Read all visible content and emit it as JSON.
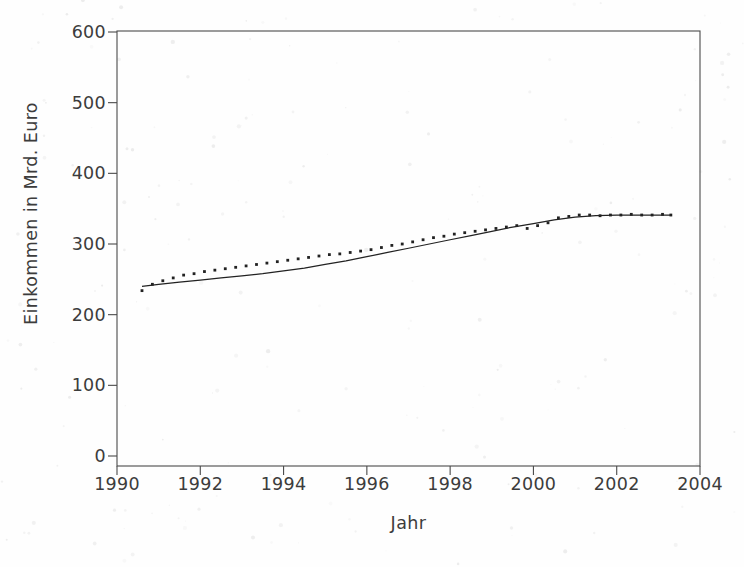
{
  "chart_data": {
    "type": "line",
    "title": "",
    "subtitle": "",
    "xlabel": "Jahr",
    "ylabel": "Einkommen in Mrd. Euro",
    "xlim": [
      1990,
      2004
    ],
    "ylim": [
      0,
      600
    ],
    "xticks": [
      1990,
      1992,
      1994,
      1996,
      1998,
      2000,
      2002,
      2004
    ],
    "xtick_labels": [
      "1990",
      "1992",
      "1994",
      "1996",
      "1998",
      "2000",
      "2002",
      "2004"
    ],
    "yticks": [
      0,
      100,
      200,
      300,
      400,
      500,
      600
    ],
    "ytick_labels": [
      "0",
      "100",
      "200",
      "300",
      "400",
      "500",
      "600"
    ],
    "grid": false,
    "legend": "none",
    "series": [
      {
        "name": "Beobachtete Werte",
        "marker": "dot",
        "linestyle": "none",
        "color": "#222222",
        "x": [
          1990.6,
          1990.85,
          1991.1,
          1991.35,
          1991.6,
          1991.85,
          1992.1,
          1992.35,
          1992.6,
          1992.85,
          1993.1,
          1993.35,
          1993.6,
          1993.85,
          1994.1,
          1994.35,
          1994.6,
          1994.85,
          1995.1,
          1995.35,
          1995.6,
          1995.85,
          1996.1,
          1996.35,
          1996.6,
          1996.85,
          1997.1,
          1997.35,
          1997.6,
          1997.85,
          1998.1,
          1998.35,
          1998.6,
          1998.85,
          1999.1,
          1999.35,
          1999.6,
          1999.85,
          2000.1,
          2000.35,
          2000.6,
          2000.85,
          2001.1,
          2001.35,
          2001.6,
          2001.85,
          2002.1,
          2002.35,
          2002.6,
          2002.85,
          2003.1,
          2003.3
        ],
        "y": [
          234,
          243,
          248,
          252,
          256,
          258,
          261,
          263,
          265,
          267,
          269,
          271,
          273,
          275,
          277,
          279,
          281,
          283,
          285,
          286,
          288,
          290,
          292,
          295,
          298,
          300,
          303,
          306,
          309,
          311,
          314,
          316,
          318,
          320,
          322,
          324,
          326,
          322,
          326,
          330,
          337,
          339,
          341,
          341,
          340,
          341,
          341,
          342,
          341,
          341,
          342,
          341
        ]
      },
      {
        "name": "Geglaettete Trendkurve",
        "marker": "none",
        "linestyle": "solid",
        "color": "#222222",
        "x": [
          1990.6,
          1991.0,
          1991.5,
          1992.0,
          1992.5,
          1993.0,
          1993.5,
          1994.0,
          1994.5,
          1995.0,
          1995.5,
          1996.0,
          1996.5,
          1997.0,
          1997.5,
          1998.0,
          1998.5,
          1999.0,
          1999.5,
          2000.0,
          2000.5,
          2001.0,
          2001.5,
          2002.0,
          2002.5,
          2003.0,
          2003.3
        ],
        "y": [
          240,
          243,
          246,
          249,
          252,
          255,
          258,
          262,
          266,
          271,
          276,
          282,
          288,
          294,
          300,
          306,
          312,
          318,
          324,
          329,
          334,
          338,
          340,
          341,
          341,
          341,
          341
        ]
      }
    ]
  },
  "axes": {
    "frame_color": "#4a4a4a",
    "tick_color": "#4a4a4a",
    "text_color": "#3c3c3c",
    "background": "#fefefe"
  }
}
